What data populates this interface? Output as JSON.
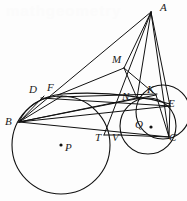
{
  "figure": {
    "type": "euclidean-geometry-diagram",
    "canvas": {
      "width": 187,
      "height": 201
    },
    "stroke_color": "#111111",
    "background_color": "#fdfdfd",
    "watermark_text": "mathgeometry"
  },
  "points": [
    {
      "id": "A",
      "label": "A",
      "x": 151,
      "y": 12,
      "label_x": 160,
      "label_y": 2,
      "dot": false
    },
    {
      "id": "M",
      "label": "M",
      "x": 124,
      "y": 68,
      "label_x": 112,
      "label_y": 54,
      "dot": false
    },
    {
      "id": "D",
      "label": "D",
      "x": 44,
      "y": 96,
      "label_x": 29,
      "label_y": 84,
      "dot": false
    },
    {
      "id": "F",
      "label": "F",
      "x": 62,
      "y": 96,
      "label_x": 47,
      "label_y": 82,
      "dot": false
    },
    {
      "id": "N",
      "label": "N",
      "x": 137,
      "y": 98,
      "label_x": 122,
      "label_y": 91,
      "dot": false
    },
    {
      "id": "K",
      "label": "K",
      "x": 156,
      "y": 95,
      "label_x": 147,
      "label_y": 84,
      "dot": false
    },
    {
      "id": "E",
      "label": "E",
      "x": 170,
      "y": 106,
      "label_x": 168,
      "label_y": 98,
      "dot": false
    },
    {
      "id": "B",
      "label": "B",
      "x": 19,
      "y": 122,
      "label_x": 5,
      "label_y": 116,
      "dot": false
    },
    {
      "id": "Q",
      "label": "Q",
      "x": 151,
      "y": 127,
      "label_x": 135,
      "label_y": 119,
      "dot": true
    },
    {
      "id": "T",
      "label": "T",
      "x": 104,
      "y": 135,
      "label_x": 95,
      "label_y": 132,
      "dot": false
    },
    {
      "id": "V",
      "label": "V",
      "x": 120,
      "y": 135,
      "label_x": 112,
      "label_y": 132,
      "dot": false
    },
    {
      "id": "C",
      "label": "C",
      "x": 169,
      "y": 137,
      "label_x": 169,
      "label_y": 132,
      "dot": false
    },
    {
      "id": "P",
      "label": "P",
      "x": 61,
      "y": 145,
      "label_x": 65,
      "label_y": 142,
      "dot": true
    }
  ],
  "circles": [
    {
      "id": "circle-P",
      "name": "large-incircle-P",
      "cx": 61,
      "cy": 145,
      "r": 49
    },
    {
      "id": "circle-Q",
      "name": "small-incircle-Q",
      "cx": 148,
      "cy": 126,
      "r": 28
    },
    {
      "id": "circle-KEC",
      "name": "arc-through-K-E-C",
      "cx": 163,
      "cy": 112,
      "r": 27
    }
  ],
  "arcs": [
    {
      "id": "arc-BDF",
      "name": "arc-B-D-F-E",
      "d": "M 19 122 Q 30 98 62 94 Q 120 90 170 104"
    }
  ],
  "segments": [
    {
      "id": "seg-A-B",
      "from": "A",
      "to": "B",
      "x1": 151,
      "y1": 12,
      "x2": 19,
      "y2": 122
    },
    {
      "id": "seg-A-C",
      "from": "A",
      "to": "C",
      "x1": 151,
      "y1": 12,
      "x2": 169,
      "y2": 137
    },
    {
      "id": "seg-A-M",
      "from": "A",
      "to": "M",
      "x1": 151,
      "y1": 12,
      "x2": 124,
      "y2": 68
    },
    {
      "id": "seg-A-N",
      "from": "A",
      "to": "N",
      "x1": 151,
      "y1": 12,
      "x2": 137,
      "y2": 98
    },
    {
      "id": "seg-A-T",
      "from": "A",
      "to": "T",
      "x1": 151,
      "y1": 12,
      "x2": 104,
      "y2": 135
    },
    {
      "id": "seg-A-E",
      "from": "A",
      "to": "E",
      "x1": 151,
      "y1": 12,
      "x2": 170,
      "y2": 106
    },
    {
      "id": "seg-B-C",
      "from": "B",
      "to": "C",
      "x1": 19,
      "y1": 122,
      "x2": 169,
      "y2": 137
    },
    {
      "id": "seg-B-E",
      "from": "B",
      "to": "E",
      "x1": 19,
      "y1": 122,
      "x2": 170,
      "y2": 106
    },
    {
      "id": "seg-B-K",
      "from": "B",
      "to": "K",
      "x1": 19,
      "y1": 122,
      "x2": 156,
      "y2": 95
    },
    {
      "id": "seg-B-N",
      "from": "B",
      "to": "N",
      "x1": 19,
      "y1": 122,
      "x2": 137,
      "y2": 98
    },
    {
      "id": "seg-B-D",
      "from": "B",
      "to": "D",
      "x1": 19,
      "y1": 122,
      "x2": 44,
      "y2": 96
    },
    {
      "id": "seg-B-F",
      "from": "B",
      "to": "F",
      "x1": 19,
      "y1": 122,
      "x2": 62,
      "y2": 96
    },
    {
      "id": "seg-M-F",
      "from": "M",
      "to": "F",
      "x1": 124,
      "y1": 68,
      "x2": 58,
      "y2": 95
    },
    {
      "id": "seg-M-K",
      "from": "M",
      "to": "K",
      "x1": 124,
      "y1": 68,
      "x2": 156,
      "y2": 95
    },
    {
      "id": "seg-M-N",
      "from": "M",
      "to": "N",
      "x1": 124,
      "y1": 68,
      "x2": 137,
      "y2": 98
    },
    {
      "id": "seg-D-E",
      "from": "D",
      "to": "E",
      "x1": 41,
      "y1": 98,
      "x2": 170,
      "y2": 106
    },
    {
      "id": "seg-F-K",
      "from": "F",
      "to": "K",
      "x1": 57,
      "y1": 97,
      "x2": 157,
      "y2": 94
    },
    {
      "id": "seg-T-V",
      "from": "T",
      "to": "V",
      "x1": 104,
      "y1": 135,
      "x2": 120,
      "y2": 135
    },
    {
      "id": "seg-K-C",
      "from": "K",
      "to": "C",
      "x1": 156,
      "y1": 95,
      "x2": 169,
      "y2": 137
    },
    {
      "id": "seg-E-C",
      "from": "E",
      "to": "C",
      "x1": 170,
      "y1": 106,
      "x2": 169,
      "y2": 137
    },
    {
      "id": "seg-V-C",
      "from": "V",
      "to": "C",
      "x1": 120,
      "y1": 135,
      "x2": 169,
      "y2": 137
    }
  ]
}
